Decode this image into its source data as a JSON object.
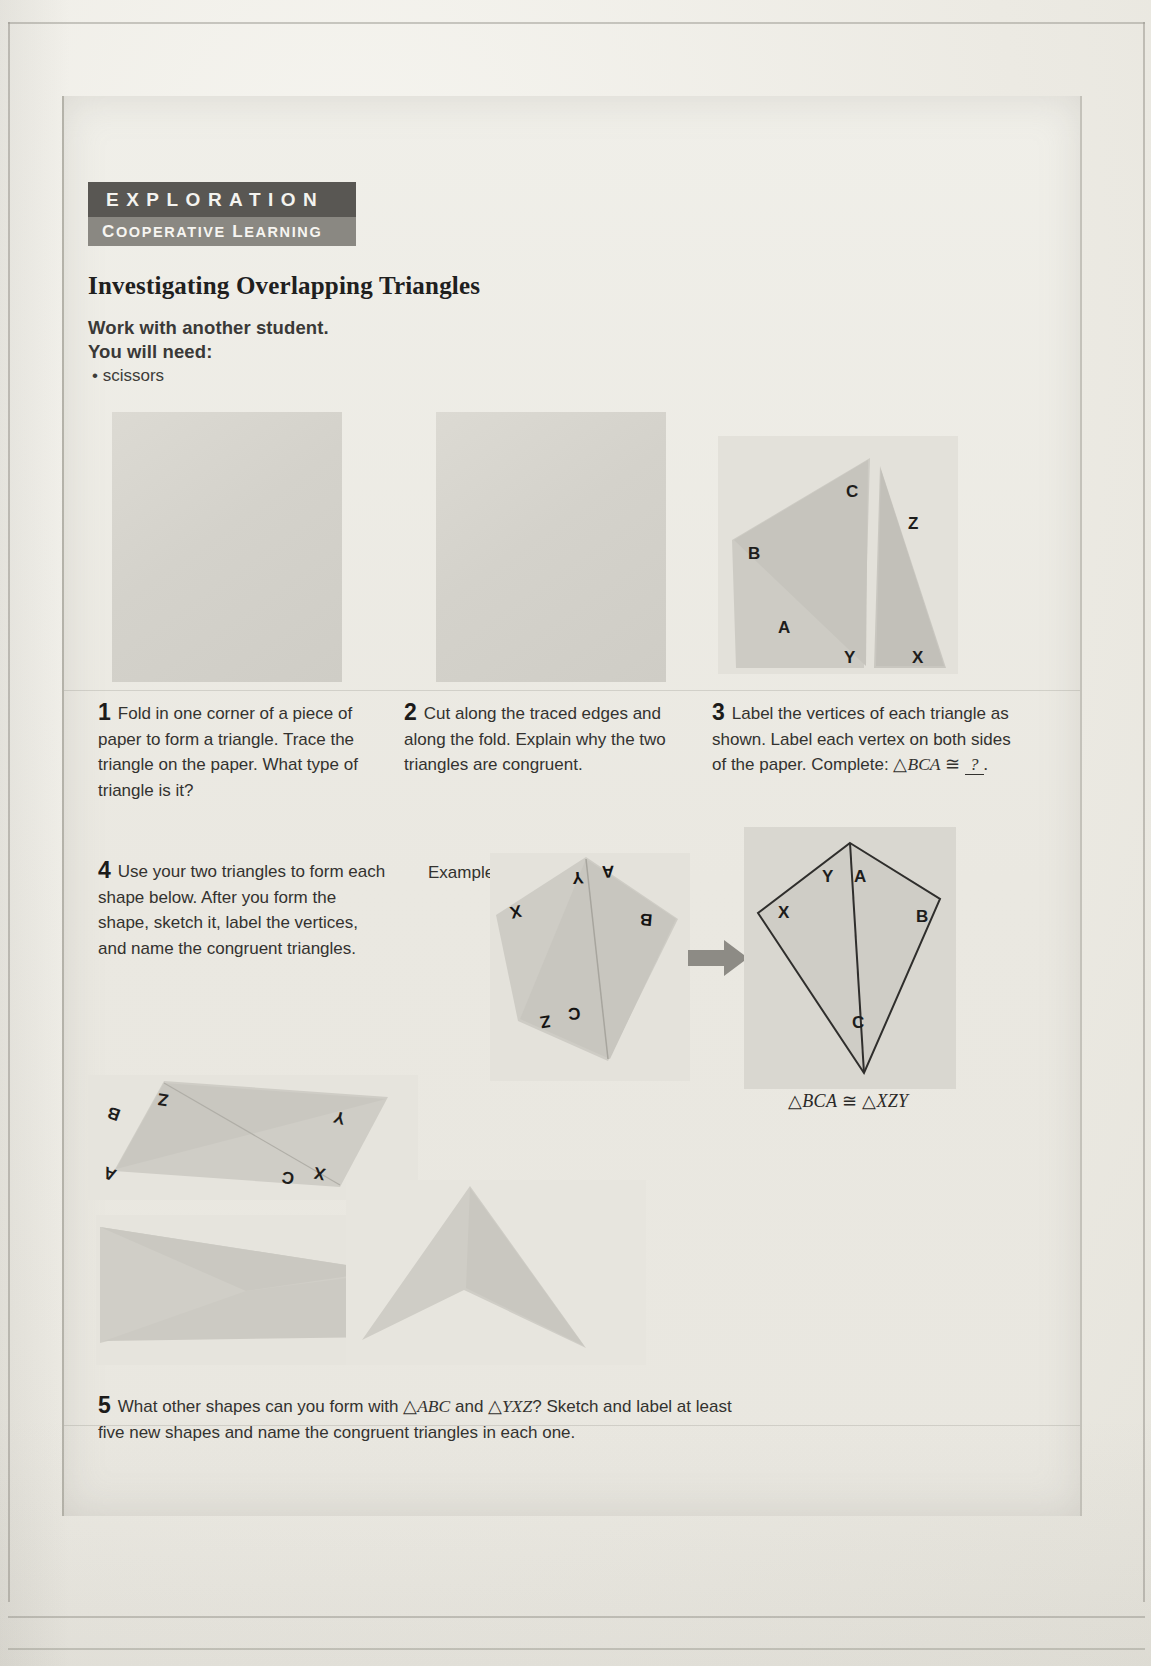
{
  "banner": {
    "line1": "EXPLORATION",
    "line2_parts": [
      "C",
      "OOPERATIVE",
      " L",
      "EARNING"
    ],
    "line2": "COOPERATIVE LEARNING"
  },
  "heading": {
    "title": "Investigating Overlapping Triangles",
    "work_with": "Work with another student.",
    "you_will_need": "You will need:",
    "materials": [
      "scissors"
    ],
    "bullet": "•"
  },
  "steps": [
    {
      "number": "1",
      "text": "Fold in one corner of a piece of paper to form a triangle. Trace the triangle on the paper. What type of triangle is it?"
    },
    {
      "number": "2",
      "text": "Cut along the traced edges and along the fold. Explain why the two triangles are congruent."
    },
    {
      "number": "3",
      "text_before": "Label the vertices of each triangle as shown. Label each vertex on both sides of the paper. Complete:",
      "math_tri": "△",
      "math_bca": "BCA",
      "math_cong": "≅",
      "math_blank": "?",
      "math_period": "."
    },
    {
      "number": "4",
      "text": "Use your two triangles to form each shape below. After you form the shape, sketch it, label the vertices, and name the congruent triangles."
    },
    {
      "number": "5",
      "text_a": "What other shapes can you form with",
      "text_tri1": "△",
      "text_abc": "ABC",
      "text_and": "and",
      "text_tri2": "△",
      "text_yxz": "YXZ",
      "text_b": "? Sketch and label at least five new shapes and name the congruent triangles in each one."
    }
  ],
  "example": {
    "label": "Example:",
    "arrow_icon": "right-arrow",
    "caption_tri1": "△",
    "caption_bca": "BCA",
    "caption_cong": "≅",
    "caption_tri2": "△",
    "caption_xzy": "XZY",
    "caption_full": "△BCA ≅ △XZY"
  },
  "photo_labels": {
    "photo3": [
      {
        "text": "C",
        "x": 128,
        "y": 50
      },
      {
        "text": "Z",
        "x": 190,
        "y": 82
      },
      {
        "text": "B",
        "x": 32,
        "y": 112
      },
      {
        "text": "A",
        "x": 62,
        "y": 185
      },
      {
        "text": "Y",
        "x": 128,
        "y": 216
      },
      {
        "text": "X",
        "x": 195,
        "y": 216
      }
    ],
    "kite_shape": [
      {
        "text": "A",
        "x": 115,
        "y": 12
      },
      {
        "text": "Y",
        "x": 82,
        "y": 18
      },
      {
        "text": "X",
        "x": 22,
        "y": 52
      },
      {
        "text": "B",
        "x": 150,
        "y": 60
      },
      {
        "text": "C",
        "x": 80,
        "y": 155
      },
      {
        "text": "Z",
        "x": 52,
        "y": 162
      }
    ],
    "kite_diagram": [
      {
        "text": "Y",
        "x": 80,
        "y": 48
      },
      {
        "text": "A",
        "x": 110,
        "y": 48
      },
      {
        "text": "X",
        "x": 36,
        "y": 82
      },
      {
        "text": "B",
        "x": 172,
        "y": 85
      },
      {
        "text": "C",
        "x": 110,
        "y": 192
      }
    ],
    "parallelogram": [
      {
        "text": "B",
        "x": 22,
        "y": 32
      },
      {
        "text": "Z",
        "x": 72,
        "y": 18
      },
      {
        "text": "Y",
        "x": 248,
        "y": 36
      },
      {
        "text": "A",
        "x": 18,
        "y": 92
      },
      {
        "text": "C",
        "x": 196,
        "y": 96
      },
      {
        "text": "X",
        "x": 228,
        "y": 92
      }
    ]
  },
  "colors": {
    "banner_top_bg": "#595753",
    "banner_bottom_bg": "#8a8882",
    "banner_text": "#f4f3ef",
    "page_bg": "#eceae3",
    "paper_photo": "#d6d4cd",
    "ink": "#33322f"
  }
}
